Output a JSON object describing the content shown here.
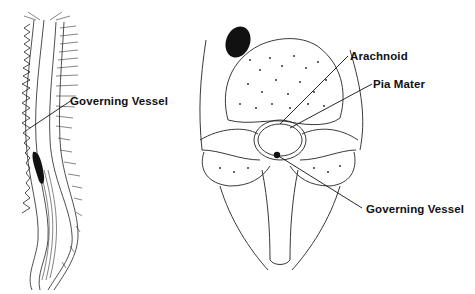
{
  "figures": {
    "spine_sagittal": {
      "labels": [
        {
          "text": "Governing Vessel",
          "x": 70,
          "y": 95
        }
      ]
    },
    "vertebra_cross_section": {
      "labels": [
        {
          "text": "Arachnoid",
          "x": 350,
          "y": 50
        },
        {
          "text": "Pia Mater",
          "x": 373,
          "y": 78
        },
        {
          "text": "Governing Vessel",
          "x": 366,
          "y": 203
        }
      ]
    }
  }
}
